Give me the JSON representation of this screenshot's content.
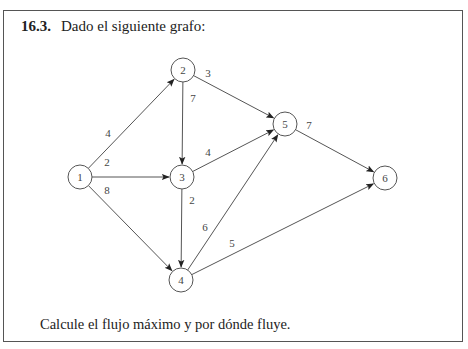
{
  "problem": {
    "number": "16.3.",
    "prompt": "Dado el siguiente grafo:",
    "question": "Calcule el flujo máximo y por dónde fluye."
  },
  "graph": {
    "nodes": [
      {
        "id": "1",
        "label": "1",
        "x": 80,
        "y": 177
      },
      {
        "id": "2",
        "label": "2",
        "x": 183,
        "y": 70
      },
      {
        "id": "3",
        "label": "3",
        "x": 182,
        "y": 177
      },
      {
        "id": "4",
        "label": "4",
        "x": 181,
        "y": 280
      },
      {
        "id": "5",
        "label": "5",
        "x": 285,
        "y": 124
      },
      {
        "id": "6",
        "label": "6",
        "x": 385,
        "y": 178
      }
    ],
    "edges": [
      {
        "from": "1",
        "to": "2",
        "capacity": "4",
        "lx": 108,
        "ly": 133
      },
      {
        "from": "1",
        "to": "3",
        "capacity": "2",
        "lx": 107,
        "ly": 162
      },
      {
        "from": "1",
        "to": "4",
        "capacity": "8",
        "lx": 107,
        "ly": 190
      },
      {
        "from": "2",
        "to": "3",
        "capacity": "7",
        "lx": 193,
        "ly": 98
      },
      {
        "from": "2",
        "to": "5",
        "capacity": "3",
        "lx": 208,
        "ly": 73
      },
      {
        "from": "3",
        "to": "5",
        "capacity": "4",
        "lx": 208,
        "ly": 152
      },
      {
        "from": "3",
        "to": "4",
        "capacity": "2",
        "lx": 192,
        "ly": 200
      },
      {
        "from": "4",
        "to": "5",
        "capacity": "6",
        "lx": 205,
        "ly": 227
      },
      {
        "from": "4",
        "to": "6",
        "capacity": "5",
        "lx": 232,
        "ly": 243
      },
      {
        "from": "5",
        "to": "6",
        "capacity": "7",
        "lx": 309,
        "ly": 125
      }
    ],
    "node_radius": 12
  }
}
